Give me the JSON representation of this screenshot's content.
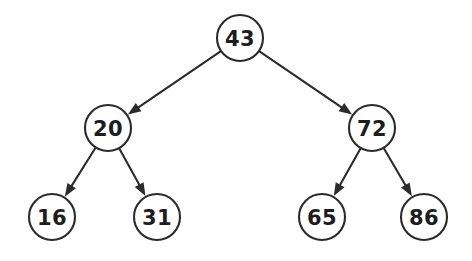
{
  "diagram": {
    "type": "binary-search-tree",
    "background_color": "#ffffff",
    "node_fill": "#ffffff",
    "node_stroke": "#2b2b2b",
    "label_color": "#1d1d1d",
    "edge_color": "#2b2b2b",
    "nodes": [
      {
        "id": "root",
        "label": "43",
        "cx": 240,
        "cy": 38,
        "r": 23
      },
      {
        "id": "n20",
        "label": "20",
        "cx": 108,
        "cy": 128,
        "r": 23
      },
      {
        "id": "n72",
        "label": "72",
        "cx": 372,
        "cy": 128,
        "r": 23
      },
      {
        "id": "n16",
        "label": "16",
        "cx": 52,
        "cy": 217,
        "r": 23
      },
      {
        "id": "n31",
        "label": "31",
        "cx": 157,
        "cy": 217,
        "r": 23
      },
      {
        "id": "n65",
        "label": "65",
        "cx": 322,
        "cy": 217,
        "r": 23
      },
      {
        "id": "n86",
        "label": "86",
        "cx": 424,
        "cy": 217,
        "r": 23
      }
    ],
    "edges": [
      {
        "id": "e-root-20",
        "from": "root",
        "to": "n20",
        "arrow": true
      },
      {
        "id": "e-root-72",
        "from": "root",
        "to": "n72",
        "arrow": true
      },
      {
        "id": "e-20-16",
        "from": "n20",
        "to": "n16",
        "arrow": true
      },
      {
        "id": "e-20-31",
        "from": "n20",
        "to": "n31",
        "arrow": true
      },
      {
        "id": "e-72-65",
        "from": "n72",
        "to": "n65",
        "arrow": true
      },
      {
        "id": "e-72-86",
        "from": "n72",
        "to": "n86",
        "arrow": true
      }
    ]
  }
}
